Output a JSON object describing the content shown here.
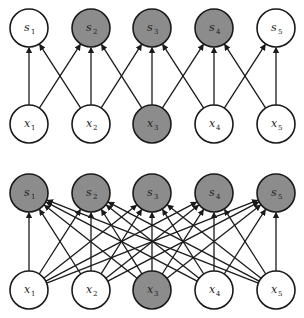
{
  "diagram": {
    "colors": {
      "shaded": "#8c8c8c",
      "unshaded": "#ffffff",
      "stroke": "#1a1a1a"
    },
    "node_radius": 19,
    "columns_x": [
      29,
      91,
      152,
      214,
      276
    ],
    "panels": [
      {
        "name": "sparse-connectivity",
        "output_row_y": 28,
        "input_row_y": 124,
        "outputs": [
          {
            "label": "s",
            "sub": "1",
            "shaded": false
          },
          {
            "label": "s",
            "sub": "2",
            "shaded": true
          },
          {
            "label": "s",
            "sub": "3",
            "shaded": true
          },
          {
            "label": "s",
            "sub": "4",
            "shaded": true
          },
          {
            "label": "s",
            "sub": "5",
            "shaded": false
          }
        ],
        "inputs": [
          {
            "label": "x",
            "sub": "1",
            "shaded": false
          },
          {
            "label": "x",
            "sub": "2",
            "shaded": false
          },
          {
            "label": "x",
            "sub": "3",
            "shaded": true
          },
          {
            "label": "x",
            "sub": "4",
            "shaded": false
          },
          {
            "label": "x",
            "sub": "5",
            "shaded": false
          }
        ],
        "edges": [
          [
            0,
            0
          ],
          [
            0,
            1
          ],
          [
            1,
            0
          ],
          [
            1,
            1
          ],
          [
            1,
            2
          ],
          [
            2,
            1
          ],
          [
            2,
            2
          ],
          [
            2,
            3
          ],
          [
            3,
            2
          ],
          [
            3,
            3
          ],
          [
            3,
            4
          ],
          [
            4,
            3
          ],
          [
            4,
            4
          ]
        ]
      },
      {
        "name": "dense-connectivity",
        "output_row_y": 193,
        "input_row_y": 290,
        "outputs": [
          {
            "label": "s",
            "sub": "1",
            "shaded": true
          },
          {
            "label": "s",
            "sub": "2",
            "shaded": true
          },
          {
            "label": "s",
            "sub": "3",
            "shaded": true
          },
          {
            "label": "s",
            "sub": "4",
            "shaded": true
          },
          {
            "label": "s",
            "sub": "5",
            "shaded": true
          }
        ],
        "inputs": [
          {
            "label": "x",
            "sub": "1",
            "shaded": false
          },
          {
            "label": "x",
            "sub": "2",
            "shaded": false
          },
          {
            "label": "x",
            "sub": "3",
            "shaded": true
          },
          {
            "label": "x",
            "sub": "4",
            "shaded": false
          },
          {
            "label": "x",
            "sub": "5",
            "shaded": false
          }
        ],
        "edges": "all"
      }
    ]
  }
}
